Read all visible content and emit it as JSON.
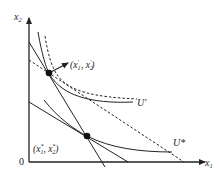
{
  "diagram": {
    "type": "consumer-choice-indifference-curves",
    "axes": {
      "x_label": "x",
      "x_sub": "1",
      "y_label": "x",
      "y_sub": "2",
      "origin_label": "0"
    },
    "points": [
      {
        "id": "upper",
        "label_open": "(x",
        "sub1": "1",
        "sup1": "′",
        "sep": " ,  x",
        "sub2": "2",
        "sup2": "′",
        "label_close": ")"
      },
      {
        "id": "lower",
        "label_open": "(x",
        "sub1": "1",
        "sup1": "*",
        "sep": ",  x",
        "sub2": "2",
        "sup2": "*",
        "label_close": ")"
      }
    ],
    "curves": {
      "u_prime_label": "U′",
      "u_star_label": "U*"
    },
    "colors": {
      "ink": "#222222",
      "background": "#ffffff"
    }
  }
}
